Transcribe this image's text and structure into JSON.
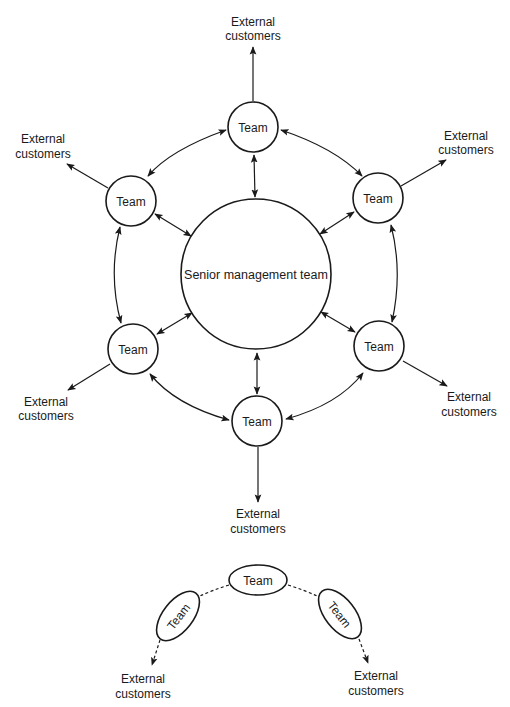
{
  "diagram": {
    "center_node": {
      "label": "Senior management team"
    },
    "team_nodes": [
      {
        "position": "top",
        "label": "Team"
      },
      {
        "position": "upper-left",
        "label": "Team"
      },
      {
        "position": "upper-right",
        "label": "Team"
      },
      {
        "position": "lower-left",
        "label": "Team"
      },
      {
        "position": "lower-right",
        "label": "Team"
      },
      {
        "position": "bottom",
        "label": "Team"
      }
    ],
    "external_labels": [
      {
        "position": "top",
        "line1": "External",
        "line2": "customers"
      },
      {
        "position": "upper-left",
        "line1": "External",
        "line2": "customers"
      },
      {
        "position": "upper-right",
        "line1": "External",
        "line2": "customers"
      },
      {
        "position": "lower-left",
        "line1": "External",
        "line2": "customers"
      },
      {
        "position": "lower-right",
        "line1": "External",
        "line2": "customers"
      },
      {
        "position": "bottom",
        "line1": "External",
        "line2": "customers"
      }
    ],
    "edges": [
      "team-top <-> team-upper-left",
      "team-top <-> team-upper-right",
      "team-upper-left <-> team-lower-left",
      "team-upper-right <-> team-lower-right",
      "team-lower-left <-> team-bottom",
      "team-lower-right <-> team-bottom",
      "each team <-> senior management team",
      "each team -> external customers"
    ]
  },
  "inset": {
    "team_nodes": [
      {
        "position": "left",
        "label": "Team"
      },
      {
        "position": "top",
        "label": "Team"
      },
      {
        "position": "right",
        "label": "Team"
      }
    ],
    "external_labels": [
      {
        "position": "left",
        "line1": "External",
        "line2": "customers"
      },
      {
        "position": "right",
        "line1": "External",
        "line2": "customers"
      }
    ],
    "edges": [
      "team-left - - team-top (dashed)",
      "team-top - - team-right (dashed)",
      "team-left - -> external customers (dashed)",
      "team-right - -> external customers (dashed)"
    ]
  }
}
